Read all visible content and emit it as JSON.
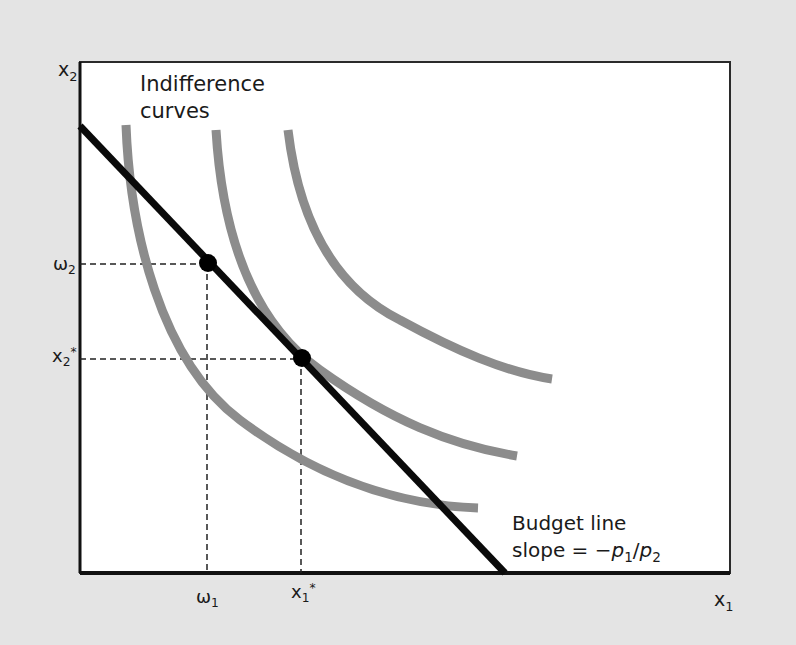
{
  "diagram": {
    "title_line1": "Indifference",
    "title_line2": "curves",
    "y_axis_label": "x",
    "y_axis_sub": "2",
    "x_axis_label": "x",
    "x_axis_sub": "1",
    "ticks": {
      "omega1": {
        "base": "ω",
        "sub": "1"
      },
      "x1star": {
        "base": "x",
        "sub": "1",
        "sup": "*"
      },
      "omega2": {
        "base": "ω",
        "sub": "2"
      },
      "x2star": {
        "base": "x",
        "sub": "2",
        "sup": "*"
      }
    },
    "budget_label_line1": "Budget line",
    "budget_label_line2_prefix": "slope =  −",
    "budget_p": "p",
    "budget_p1_sub": "1",
    "budget_slash": "/",
    "budget_p2_sub": "2",
    "colors": {
      "background": "#e4e4e4",
      "plot_area": "#ffffff",
      "axis": "#111111",
      "budget_line": "#0a0a0a",
      "indifference_curve": "#8c8c8c",
      "guide": "#222222"
    },
    "points": [
      {
        "name": "endowment",
        "label": "(ω1, ω2)"
      },
      {
        "name": "optimal-choice",
        "label": "(x1*, x2*)"
      }
    ]
  }
}
